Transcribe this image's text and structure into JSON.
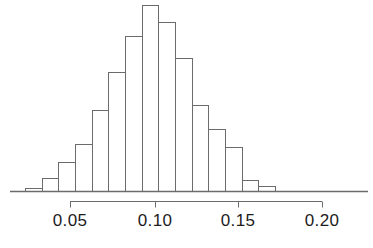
{
  "figure": {
    "kind": "histogram-figure",
    "background": "#ffffff",
    "line_color": "#6b6b6b",
    "text_color": "#1c1c1c",
    "baseline_y": 191,
    "axis_rule_y": 201,
    "pixels_per_unit": 1670,
    "x_origin_px": 70,
    "x_origin_value": 0.05,
    "y_pixels_per_count": 1.0
  },
  "chart_data": {
    "type": "bar",
    "title": "",
    "subtitle": "",
    "xlabel": "",
    "ylabel": "",
    "grid": false,
    "legend": false,
    "legend_position": "none",
    "bin_width": 0.01,
    "xlim": [
      0.02,
      0.21
    ],
    "ylim": [
      0,
      186
    ],
    "axis_ticks": [
      0.05,
      0.1,
      0.15,
      0.2
    ],
    "tick_labels": [
      "0.05",
      "0.10",
      "0.15",
      "0.20"
    ],
    "bin_edges": [
      0.023,
      0.033,
      0.043,
      0.053,
      0.063,
      0.073,
      0.083,
      0.093,
      0.103,
      0.113,
      0.123,
      0.133,
      0.143,
      0.153,
      0.163,
      0.173
    ],
    "categories": [
      "0.023-0.033",
      "0.033-0.043",
      "0.043-0.053",
      "0.053-0.063",
      "0.063-0.073",
      "0.073-0.083",
      "0.083-0.093",
      "0.093-0.103",
      "0.103-0.113",
      "0.113-0.123",
      "0.123-0.133",
      "0.133-0.143",
      "0.143-0.153",
      "0.153-0.163",
      "0.163-0.173"
    ],
    "values": [
      3,
      13,
      29,
      47,
      81,
      119,
      155,
      186,
      169,
      133,
      86,
      62,
      44,
      11,
      5
    ],
    "bars": [
      {
        "x0": 0.023,
        "x1": 0.033,
        "value": 3,
        "px_left": 25,
        "px_right": 42,
        "px_top": 188
      },
      {
        "x0": 0.033,
        "x1": 0.043,
        "value": 13,
        "px_left": 42,
        "px_right": 58,
        "px_top": 178
      },
      {
        "x0": 0.043,
        "x1": 0.053,
        "value": 29,
        "px_left": 58,
        "px_right": 75,
        "px_top": 162
      },
      {
        "x0": 0.053,
        "x1": 0.063,
        "value": 47,
        "px_left": 75,
        "px_right": 92,
        "px_top": 144
      },
      {
        "x0": 0.063,
        "x1": 0.073,
        "value": 81,
        "px_left": 92,
        "px_right": 108,
        "px_top": 110
      },
      {
        "x0": 0.073,
        "x1": 0.083,
        "value": 119,
        "px_left": 108,
        "px_right": 125,
        "px_top": 72
      },
      {
        "x0": 0.083,
        "x1": 0.093,
        "value": 155,
        "px_left": 125,
        "px_right": 142,
        "px_top": 36
      },
      {
        "x0": 0.093,
        "x1": 0.103,
        "value": 186,
        "px_left": 142,
        "px_right": 158,
        "px_top": 5
      },
      {
        "x0": 0.103,
        "x1": 0.113,
        "value": 169,
        "px_left": 158,
        "px_right": 175,
        "px_top": 22
      },
      {
        "x0": 0.113,
        "x1": 0.123,
        "value": 133,
        "px_left": 175,
        "px_right": 192,
        "px_top": 58
      },
      {
        "x0": 0.123,
        "x1": 0.133,
        "value": 86,
        "px_left": 192,
        "px_right": 208,
        "px_top": 105
      },
      {
        "x0": 0.133,
        "x1": 0.143,
        "value": 62,
        "px_left": 208,
        "px_right": 225,
        "px_top": 129
      },
      {
        "x0": 0.143,
        "x1": 0.153,
        "value": 44,
        "px_left": 225,
        "px_right": 242,
        "px_top": 147
      },
      {
        "x0": 0.153,
        "x1": 0.163,
        "value": 11,
        "px_left": 242,
        "px_right": 258,
        "px_top": 180
      },
      {
        "x0": 0.163,
        "x1": 0.173,
        "value": 5,
        "px_left": 258,
        "px_right": 275,
        "px_top": 186
      }
    ]
  },
  "axis": {
    "ticks": [
      {
        "label": "0.05",
        "value": 0.05,
        "px_x": 70
      },
      {
        "label": "0.10",
        "value": 0.1,
        "px_x": 155
      },
      {
        "label": "0.15",
        "value": 0.15,
        "px_x": 238
      },
      {
        "label": "0.20",
        "value": 0.2,
        "px_x": 322
      }
    ],
    "rule_left_px": 70,
    "rule_right_px": 322,
    "baseline_left_px": 10,
    "baseline_right_px": 368
  }
}
